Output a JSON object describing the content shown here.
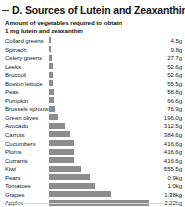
{
  "panel": {
    "title": "D. Sources of Lutein and Zeaxanthin",
    "subtitle": "Amount of vegetables required to obtain 1 mg lutein and zeaxanthin",
    "bar_color": "#8d8d8d",
    "rule_color": "#2b2b2b"
  },
  "chart_data": {
    "type": "bar",
    "orientation": "horizontal",
    "title": "D. Sources of Lutein and Zeaxanthin",
    "subtitle": "Amount of vegetables required to obtain 1 mg lutein and zeaxanthin",
    "xlabel": "",
    "ylabel": "",
    "grid": false,
    "legend": false,
    "unit_note": "mass of food required per 1 mg lutein + zeaxanthin",
    "categories": [
      "Collard greens",
      "Spinach",
      "Celery greens",
      "Leeks",
      "Broccoli",
      "Boston lettuce",
      "Peas",
      "Pumpkin",
      "Brussels sprouts",
      "Green olives",
      "Avocado",
      "Carrots",
      "Cucumbers",
      "Plums",
      "Currants",
      "Kiwi",
      "Pears",
      "Tomatoes",
      "Grapes",
      "Apples"
    ],
    "value_labels": [
      "4.5g",
      "9.8g",
      "27.7g",
      "52.6g",
      "52.6g",
      "55.5g",
      "58.8g",
      "66.6g",
      "76.9g",
      "196.0g",
      "312.5g",
      "384.6g",
      "416.6g",
      "416.6g",
      "416.6g",
      "555.5g",
      "0.9kg",
      "1.0kg",
      "1.38kg",
      "2.22kg"
    ],
    "values_grams": [
      4.5,
      9.8,
      27.7,
      52.6,
      52.6,
      55.5,
      58.8,
      66.6,
      76.9,
      196.0,
      312.5,
      384.6,
      416.6,
      416.6,
      416.6,
      555.5,
      900,
      1000,
      1380,
      2220
    ],
    "bar_pixel_widths": [
      2,
      2,
      3,
      4,
      4,
      4,
      5,
      5,
      6,
      9,
      16,
      21,
      25,
      25,
      25,
      32,
      41,
      46,
      62,
      100
    ]
  }
}
